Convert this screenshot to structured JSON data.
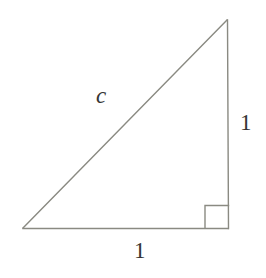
{
  "figure": {
    "kind": "right-triangle-diagram",
    "background_color": "#ffffff",
    "stroke_color": "#8a8a82",
    "text_color": "#353533",
    "stroke_width": 1.4,
    "canvas": {
      "width": 266,
      "height": 278
    },
    "vertices": {
      "apex": {
        "x": 227,
        "y": 20
      },
      "bottom_left": {
        "x": 23,
        "y": 228
      },
      "bottom_right": {
        "x": 228,
        "y": 228
      }
    },
    "right_angle_marker": {
      "x": 205,
      "y": 205,
      "size": 23,
      "at_vertex": "bottom_right"
    },
    "labels": {
      "hypotenuse": "c",
      "vertical_leg": "1",
      "horizontal_leg": "1"
    }
  }
}
